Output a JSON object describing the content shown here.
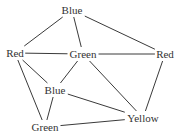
{
  "figure": {
    "name": "graph-coloring-diagram",
    "width": 181,
    "height": 139,
    "background_color": "#ffffff",
    "edge_color": "#3a3a3a",
    "label_color": "#333333",
    "edge_width": 1
  },
  "nodes": [
    {
      "id": "blue-top",
      "label": "Blue",
      "x": 72,
      "y": 10
    },
    {
      "id": "red-left",
      "label": "Red",
      "x": 15,
      "y": 53
    },
    {
      "id": "green-center",
      "label": "Green",
      "x": 83,
      "y": 54
    },
    {
      "id": "red-right",
      "label": "Red",
      "x": 165,
      "y": 54
    },
    {
      "id": "blue-mid",
      "label": "Blue",
      "x": 55,
      "y": 90
    },
    {
      "id": "green-bottom",
      "label": "Green",
      "x": 45,
      "y": 127
    },
    {
      "id": "yellow",
      "label": "Yellow",
      "x": 143,
      "y": 118
    }
  ],
  "edges": [
    {
      "from": "blue-top",
      "to": "red-left"
    },
    {
      "from": "blue-top",
      "to": "green-center"
    },
    {
      "from": "blue-top",
      "to": "red-right"
    },
    {
      "from": "red-left",
      "to": "green-center"
    },
    {
      "from": "green-center",
      "to": "red-right"
    },
    {
      "from": "red-left",
      "to": "blue-mid"
    },
    {
      "from": "red-left",
      "to": "green-bottom"
    },
    {
      "from": "green-center",
      "to": "blue-mid"
    },
    {
      "from": "green-center",
      "to": "yellow"
    },
    {
      "from": "blue-mid",
      "to": "green-bottom"
    },
    {
      "from": "blue-mid",
      "to": "yellow"
    },
    {
      "from": "green-bottom",
      "to": "yellow"
    },
    {
      "from": "red-right",
      "to": "yellow"
    }
  ]
}
